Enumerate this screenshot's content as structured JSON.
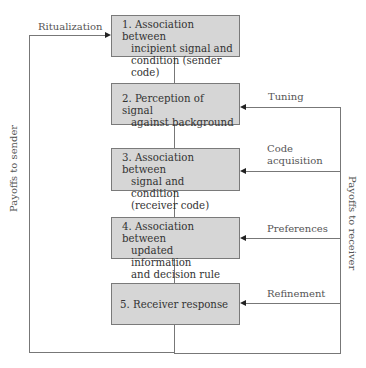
{
  "diagram": {
    "boxes": [
      {
        "lines": [
          "1. Association between",
          "incipient signal and",
          "condition (sender code)"
        ]
      },
      {
        "lines": [
          "2. Perception of signal",
          "against background"
        ]
      },
      {
        "lines": [
          "3. Association between",
          "signal and condition",
          "(receiver code)"
        ]
      },
      {
        "lines": [
          "4. Association between",
          "updated information",
          "and decision rule"
        ]
      },
      {
        "lines": [
          "5. Receiver response"
        ]
      }
    ],
    "left_loop": {
      "label": "Ritualization",
      "axis_label": "Payoffs to sender"
    },
    "right_loop": {
      "axis_label": "Payoffs to receiver",
      "labels": [
        "Tuning",
        "Code",
        "acquisition",
        "Preferences",
        "Refinement"
      ]
    },
    "colors": {
      "box_fill": "#d6d6d6",
      "box_border": "#7a7a7a",
      "line": "#777777"
    }
  }
}
